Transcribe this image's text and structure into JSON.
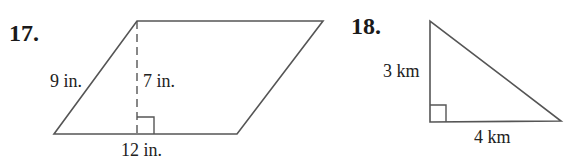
{
  "problems": [
    {
      "number": "17.",
      "shape": "parallelogram",
      "labels": {
        "side": "9 in.",
        "height": "7 in.",
        "base": "12 in."
      }
    },
    {
      "number": "18.",
      "shape": "right-triangle",
      "labels": {
        "leg_vertical": "3 km",
        "leg_horizontal": "4 km"
      }
    }
  ],
  "colors": {
    "stroke": "#555555",
    "text": "#222222"
  }
}
